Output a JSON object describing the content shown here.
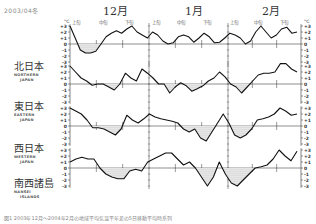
{
  "header": {
    "date_code": "2003/04冬",
    "months": [
      "12月",
      "1月",
      "2月"
    ],
    "periods": [
      "上旬",
      "中旬",
      "下旬",
      "上旬",
      "中旬",
      "下旬",
      "上旬",
      "中旬",
      "下旬"
    ]
  },
  "regions": [
    {
      "jp": "北日本",
      "en1": "NORTHERN",
      "en2": "JAPAN"
    },
    {
      "jp": "東日本",
      "en1": "EASTERN",
      "en2": "JAPAN"
    },
    {
      "jp": "西日本",
      "en1": "WESTERN",
      "en2": "JAPAN"
    },
    {
      "jp": "南西諸島",
      "en1": "NANSEI",
      "en2": "ISLANDS"
    }
  ],
  "caption": "図1 2003年12月～2004年2月の地域平均気温平年差の5日移動平均時系列",
  "chart_data": {
    "type": "line",
    "xlabel": "12月上旬 — 2月下旬",
    "ylabel": "°C",
    "ylim": [
      -3,
      3
    ],
    "yticks": [
      -3,
      -2,
      -1,
      0,
      1,
      2,
      3
    ],
    "ytick_labels": [
      "-3",
      "-2",
      "-1",
      "0",
      "+1",
      "+2",
      "+3"
    ],
    "x_periods": [
      "12月上旬",
      "12月中旬",
      "12月下旬",
      "1月上旬",
      "1月中旬",
      "1月下旬",
      "2月上旬",
      "2月中旬",
      "2月下旬"
    ],
    "negative_shaded": true,
    "series": [
      {
        "name": "北日本",
        "values": [
          3.0,
          1.0,
          -1.0,
          -1.5,
          -1.5,
          -1.2,
          0.0,
          1.2,
          1.8,
          2.2,
          1.8,
          2.5,
          3.0,
          2.0,
          1.5,
          1.0,
          2.0,
          1.5,
          0.5,
          0.0,
          0.2,
          1.2,
          1.5,
          1.2,
          0.3,
          1.0,
          1.8,
          1.2,
          0.2,
          0.3,
          1.0,
          1.8,
          1.5,
          1.0,
          0.0,
          0.5,
          2.0,
          3.0,
          2.0,
          1.0,
          1.5,
          2.5,
          2.8,
          1.8,
          2.0
        ]
      },
      {
        "name": "東日本",
        "values": [
          3.0,
          2.0,
          1.0,
          0.5,
          -0.2,
          0.0,
          0.0,
          -0.5,
          -1.0,
          0.0,
          1.8,
          1.0,
          0.5,
          2.5,
          1.8,
          1.0,
          0.0,
          0.0,
          -1.5,
          -0.5,
          0.2,
          -0.3,
          -1.2,
          -0.8,
          -0.3,
          0.5,
          1.0,
          2.0,
          1.2,
          0.0,
          -0.5,
          -1.5,
          -0.5,
          0.5,
          1.5,
          1.8,
          1.8,
          2.0,
          3.5,
          3.5,
          2.5,
          2.0
        ]
      },
      {
        "name": "西日本",
        "values": [
          3.0,
          2.5,
          2.0,
          1.0,
          -0.3,
          -0.3,
          -0.5,
          -1.0,
          -1.5,
          -0.5,
          1.8,
          1.0,
          0.5,
          1.2,
          2.0,
          1.5,
          1.2,
          1.0,
          0.8,
          0.5,
          -0.5,
          -1.0,
          -0.5,
          -2.0,
          -2.5,
          -1.0,
          0.5,
          2.0,
          0.5,
          -1.5,
          -2.0,
          -1.5,
          -0.5,
          1.0,
          1.2,
          1.5,
          2.0,
          3.0,
          2.5,
          1.8,
          2.0
        ]
      },
      {
        "name": "南西諸島",
        "values": [
          1.0,
          1.5,
          1.8,
          1.5,
          1.5,
          0.0,
          -1.0,
          -1.5,
          -1.8,
          -1.8,
          -0.5,
          -0.2,
          -0.5,
          1.0,
          1.5,
          2.0,
          2.5,
          2.5,
          1.5,
          0.5,
          1.0,
          0.0,
          -1.5,
          -3.0,
          -1.5,
          1.0,
          -1.0,
          -2.5,
          -3.0,
          -2.0,
          -1.0,
          0.0,
          0.2,
          0.5,
          1.5,
          3.0,
          2.0,
          1.2,
          2.8
        ]
      }
    ]
  }
}
